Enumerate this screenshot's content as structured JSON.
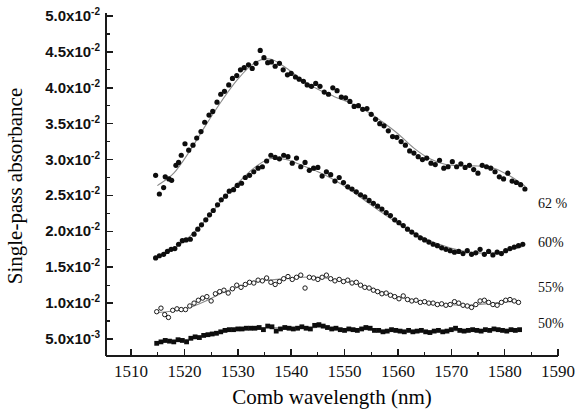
{
  "chart_data": {
    "type": "scatter",
    "title": "",
    "xlabel": "Comb wavelength (nm)",
    "ylabel": "Single-pass absorbance",
    "xlim": [
      1505.3,
      1590
    ],
    "ylim": [
      0.0027,
      0.0505
    ],
    "grid": false,
    "legend_position": "right-inside",
    "xticks": [
      1510,
      1520,
      1530,
      1540,
      1550,
      1560,
      1570,
      1580,
      1590
    ],
    "xtick_labels": [
      "1510",
      "1520",
      "1530",
      "1540",
      "1550",
      "1560",
      "1570",
      "1580",
      "1590"
    ],
    "xminor_interval": 5,
    "yticks": [
      0.005,
      0.01,
      0.015,
      0.02,
      0.025,
      0.03,
      0.035,
      0.04,
      0.045,
      0.05
    ],
    "ytick_labels": [
      {
        "mantissa": "5.0x10",
        "exponent": "-3"
      },
      {
        "mantissa": "1.0x10",
        "exponent": "-2"
      },
      {
        "mantissa": "1.5x10",
        "exponent": "-2"
      },
      {
        "mantissa": "2.0x10",
        "exponent": "-2"
      },
      {
        "mantissa": "2.5x10",
        "exponent": "-2"
      },
      {
        "mantissa": "3.0x10",
        "exponent": "-2"
      },
      {
        "mantissa": "3.5x10",
        "exponent": "-2"
      },
      {
        "mantissa": "4.0x10",
        "exponent": "-2"
      },
      {
        "mantissa": "4.5x10",
        "exponent": "-2"
      },
      {
        "mantissa": "5.0x10",
        "exponent": "-2"
      }
    ],
    "yminor_interval": 0.0025,
    "series": [
      {
        "name": "62 %",
        "label": "62 %",
        "marker": "filled-circle",
        "marker_color": "#0d0d0d",
        "fit_color": "#8a8a8a",
        "x": [
          1514.6,
          1515.3,
          1516.1,
          1516.4,
          1517.1,
          1517.6,
          1518.4,
          1518.9,
          1519.4,
          1520.1,
          1520.8,
          1521.6,
          1522.3,
          1523.1,
          1523.8,
          1524.6,
          1525.3,
          1526.1,
          1526.8,
          1527.5,
          1528.3,
          1529.0,
          1529.8,
          1530.5,
          1531.2,
          1532.0,
          1532.7,
          1533.4,
          1534.2,
          1534.9,
          1535.6,
          1536.3,
          1537.0,
          1537.8,
          1538.5,
          1539.3,
          1540.0,
          1540.8,
          1541.5,
          1542.3,
          1543.0,
          1543.8,
          1544.6,
          1545.4,
          1546.2,
          1547.0,
          1547.8,
          1548.6,
          1549.4,
          1550.2,
          1551.0,
          1551.8,
          1552.6,
          1553.4,
          1554.2,
          1555.0,
          1555.8,
          1556.6,
          1557.4,
          1558.2,
          1559.0,
          1559.8,
          1560.6,
          1561.4,
          1562.2,
          1563.0,
          1563.8,
          1564.6,
          1565.4,
          1566.2,
          1567.0,
          1567.8,
          1568.6,
          1569.4,
          1570.2,
          1571.0,
          1571.8,
          1572.6,
          1573.4,
          1574.2,
          1575.0,
          1575.8,
          1576.6,
          1577.4,
          1578.2,
          1579.0,
          1579.8,
          1580.6,
          1581.4,
          1582.2,
          1583.0,
          1583.8
        ],
        "y": [
          0.0278,
          0.0252,
          0.0261,
          0.0276,
          0.0273,
          0.0271,
          0.0292,
          0.0296,
          0.0306,
          0.0322,
          0.0313,
          0.032,
          0.033,
          0.0339,
          0.0352,
          0.0362,
          0.0367,
          0.038,
          0.0391,
          0.0395,
          0.0404,
          0.0413,
          0.0417,
          0.0425,
          0.0428,
          0.0432,
          0.0427,
          0.0434,
          0.0452,
          0.0442,
          0.0435,
          0.0436,
          0.043,
          0.0434,
          0.0425,
          0.0418,
          0.042,
          0.0415,
          0.0412,
          0.0409,
          0.0404,
          0.0402,
          0.0406,
          0.0402,
          0.0394,
          0.0391,
          0.04,
          0.0396,
          0.0387,
          0.0386,
          0.0381,
          0.0374,
          0.0375,
          0.037,
          0.0371,
          0.0363,
          0.0356,
          0.035,
          0.0347,
          0.034,
          0.0332,
          0.0331,
          0.0325,
          0.032,
          0.0312,
          0.0309,
          0.0304,
          0.03,
          0.0302,
          0.0295,
          0.0293,
          0.0299,
          0.0288,
          0.029,
          0.0297,
          0.029,
          0.0294,
          0.0289,
          0.0292,
          0.0286,
          0.0281,
          0.0292,
          0.029,
          0.0288,
          0.0283,
          0.0276,
          0.0273,
          0.0281,
          0.027,
          0.0268,
          0.0265,
          0.0259
        ],
        "fit_x": [
          1515.0,
          1518.0,
          1521.0,
          1524.0,
          1527.0,
          1530.0,
          1533.0,
          1536.0,
          1539.0,
          1542.0,
          1545.0,
          1548.0,
          1551.0,
          1554.0,
          1557.0,
          1560.0,
          1563.0,
          1566.0,
          1569.0,
          1572.0,
          1575.0,
          1578.0,
          1581.0,
          1583.8
        ],
        "fit_y": [
          0.0264,
          0.0281,
          0.0312,
          0.0348,
          0.0382,
          0.0412,
          0.0434,
          0.044,
          0.0428,
          0.0411,
          0.0398,
          0.0388,
          0.0379,
          0.0368,
          0.0353,
          0.0336,
          0.0316,
          0.0301,
          0.0293,
          0.0291,
          0.0291,
          0.0288,
          0.0277,
          0.0263
        ]
      },
      {
        "name": "60%",
        "label": "60%",
        "marker": "filled-circle",
        "marker_color": "#0d0d0d",
        "fit_color": "#8a8a8a",
        "x": [
          1514.6,
          1515.3,
          1516.1,
          1516.8,
          1517.5,
          1518.2,
          1518.9,
          1519.6,
          1520.3,
          1521.1,
          1521.8,
          1522.5,
          1523.2,
          1524.0,
          1524.7,
          1525.4,
          1526.2,
          1526.9,
          1527.7,
          1528.4,
          1529.2,
          1529.9,
          1530.7,
          1531.4,
          1532.2,
          1533.0,
          1533.8,
          1534.6,
          1535.4,
          1536.2,
          1537.0,
          1537.8,
          1538.6,
          1539.4,
          1540.2,
          1541.0,
          1541.8,
          1542.6,
          1543.4,
          1544.2,
          1545.0,
          1545.8,
          1546.6,
          1547.4,
          1548.2,
          1549.0,
          1549.8,
          1550.6,
          1551.4,
          1552.2,
          1553.0,
          1553.8,
          1554.6,
          1555.4,
          1556.2,
          1557.0,
          1557.8,
          1558.6,
          1559.4,
          1560.2,
          1561.0,
          1561.8,
          1562.6,
          1563.4,
          1564.2,
          1565.0,
          1565.8,
          1566.6,
          1567.4,
          1568.2,
          1569.0,
          1569.8,
          1570.6,
          1571.4,
          1572.2,
          1573.0,
          1573.8,
          1574.6,
          1575.4,
          1576.2,
          1577.0,
          1577.8,
          1578.6,
          1579.4,
          1580.2,
          1581.0,
          1581.8,
          1582.6,
          1583.4
        ],
        "y": [
          0.0163,
          0.0166,
          0.0168,
          0.0172,
          0.0175,
          0.0176,
          0.0182,
          0.0187,
          0.0188,
          0.0189,
          0.0196,
          0.0203,
          0.0209,
          0.0216,
          0.0223,
          0.0229,
          0.0237,
          0.0244,
          0.0249,
          0.0256,
          0.0258,
          0.0264,
          0.0267,
          0.0275,
          0.0278,
          0.0283,
          0.0288,
          0.029,
          0.0298,
          0.0306,
          0.0303,
          0.0301,
          0.0306,
          0.0304,
          0.0295,
          0.0302,
          0.029,
          0.0296,
          0.0285,
          0.0288,
          0.0289,
          0.0277,
          0.0283,
          0.0279,
          0.027,
          0.0275,
          0.0268,
          0.0262,
          0.0259,
          0.0255,
          0.0251,
          0.0248,
          0.0243,
          0.0239,
          0.0235,
          0.0231,
          0.0226,
          0.0222,
          0.0216,
          0.0212,
          0.0208,
          0.0203,
          0.0199,
          0.0195,
          0.0191,
          0.0188,
          0.0185,
          0.0182,
          0.018,
          0.0177,
          0.0175,
          0.0173,
          0.0171,
          0.0172,
          0.0169,
          0.0173,
          0.0168,
          0.017,
          0.0175,
          0.0168,
          0.0172,
          0.0167,
          0.0171,
          0.0169,
          0.0173,
          0.0176,
          0.0178,
          0.018,
          0.0182
        ],
        "fit_x": [
          1515.0,
          1518.0,
          1521.0,
          1524.0,
          1527.0,
          1530.0,
          1533.0,
          1536.0,
          1539.0,
          1542.0,
          1545.0,
          1548.0,
          1551.0,
          1554.0,
          1557.0,
          1560.0,
          1563.0,
          1566.0,
          1569.0,
          1572.0,
          1575.0,
          1578.0,
          1581.0,
          1583.4
        ],
        "fit_y": [
          0.0164,
          0.0176,
          0.0193,
          0.0216,
          0.0243,
          0.0267,
          0.0288,
          0.0301,
          0.03,
          0.0292,
          0.0283,
          0.0272,
          0.0258,
          0.0242,
          0.0226,
          0.0211,
          0.0198,
          0.0187,
          0.0179,
          0.0173,
          0.017,
          0.017,
          0.0174,
          0.0179
        ]
      },
      {
        "name": "55%",
        "label": "55%",
        "marker": "open-circle",
        "marker_color": "#ffffff",
        "fit_color": "#8a8a8a",
        "x": [
          1514.8,
          1515.6,
          1516.3,
          1517.0,
          1517.8,
          1518.6,
          1519.4,
          1520.2,
          1521.0,
          1521.8,
          1522.6,
          1523.4,
          1524.2,
          1525.0,
          1525.8,
          1526.6,
          1527.4,
          1528.2,
          1529.0,
          1529.8,
          1530.6,
          1531.4,
          1532.2,
          1533.0,
          1533.8,
          1534.6,
          1535.4,
          1536.2,
          1537.0,
          1537.8,
          1538.6,
          1539.4,
          1540.2,
          1541.0,
          1541.8,
          1542.6,
          1543.4,
          1544.2,
          1545.0,
          1545.8,
          1546.6,
          1547.4,
          1548.2,
          1549.0,
          1549.8,
          1550.6,
          1551.4,
          1552.2,
          1553.0,
          1553.8,
          1554.6,
          1555.4,
          1556.2,
          1557.0,
          1557.8,
          1558.6,
          1559.4,
          1560.2,
          1561.0,
          1561.8,
          1562.6,
          1563.4,
          1564.2,
          1565.0,
          1565.8,
          1566.6,
          1567.4,
          1568.2,
          1569.0,
          1569.8,
          1570.6,
          1571.4,
          1572.2,
          1573.0,
          1573.8,
          1574.6,
          1575.4,
          1576.2,
          1577.0,
          1577.8,
          1578.6,
          1579.4,
          1580.2,
          1581.0,
          1581.8,
          1582.6
        ],
        "y": [
          0.0088,
          0.0093,
          0.0084,
          0.008,
          0.009,
          0.0092,
          0.0091,
          0.0091,
          0.0096,
          0.01,
          0.0104,
          0.0107,
          0.0109,
          0.0103,
          0.0113,
          0.0116,
          0.0118,
          0.0114,
          0.012,
          0.0125,
          0.0122,
          0.0126,
          0.0129,
          0.0128,
          0.0132,
          0.0131,
          0.0135,
          0.0129,
          0.0126,
          0.013,
          0.0134,
          0.0137,
          0.0133,
          0.0136,
          0.0139,
          0.0121,
          0.0136,
          0.0135,
          0.0133,
          0.0136,
          0.0139,
          0.0134,
          0.0131,
          0.0133,
          0.013,
          0.0132,
          0.0128,
          0.0129,
          0.0125,
          0.0122,
          0.0121,
          0.0118,
          0.0116,
          0.0113,
          0.0114,
          0.0111,
          0.0109,
          0.0106,
          0.011,
          0.0105,
          0.0103,
          0.0104,
          0.0101,
          0.0102,
          0.01,
          0.01,
          0.0098,
          0.0099,
          0.0097,
          0.0098,
          0.0102,
          0.01,
          0.0097,
          0.0096,
          0.0094,
          0.0098,
          0.0103,
          0.0104,
          0.0101,
          0.0098,
          0.0097,
          0.0101,
          0.0104,
          0.0105,
          0.0103,
          0.0101
        ],
        "fit_x": [
          1515.0,
          1518.0,
          1521.0,
          1524.0,
          1527.0,
          1530.0,
          1533.0,
          1536.0,
          1539.0,
          1542.0,
          1545.0,
          1548.0,
          1551.0,
          1554.0,
          1557.0,
          1560.0,
          1563.0,
          1566.0,
          1569.0,
          1572.0,
          1575.0,
          1578.0,
          1581.0,
          1582.6
        ],
        "fit_y": [
          0.0087,
          0.0089,
          0.0094,
          0.0103,
          0.0114,
          0.0122,
          0.0129,
          0.0132,
          0.0134,
          0.0136,
          0.0136,
          0.0133,
          0.0129,
          0.0123,
          0.0116,
          0.0109,
          0.0104,
          0.01,
          0.0098,
          0.0097,
          0.0098,
          0.01,
          0.0102,
          0.0102
        ]
      },
      {
        "name": "50%",
        "label": "50%",
        "marker": "filled-square",
        "marker_color": "#0d0d0d",
        "fit_color": "#8a8a8a",
        "x": [
          1514.8,
          1515.6,
          1516.4,
          1517.2,
          1518.0,
          1518.8,
          1519.6,
          1520.4,
          1521.2,
          1522.0,
          1522.8,
          1523.6,
          1524.4,
          1525.2,
          1526.0,
          1526.8,
          1527.6,
          1528.4,
          1529.2,
          1530.0,
          1530.8,
          1531.6,
          1532.4,
          1533.2,
          1534.0,
          1534.8,
          1535.6,
          1536.4,
          1537.2,
          1538.0,
          1538.8,
          1539.6,
          1540.4,
          1541.2,
          1542.0,
          1542.8,
          1543.6,
          1544.4,
          1545.2,
          1546.0,
          1546.8,
          1547.6,
          1548.4,
          1549.2,
          1550.0,
          1550.8,
          1551.6,
          1552.4,
          1553.2,
          1554.0,
          1554.8,
          1555.6,
          1556.4,
          1557.2,
          1558.0,
          1558.8,
          1559.6,
          1560.4,
          1561.2,
          1562.0,
          1562.8,
          1563.6,
          1564.4,
          1565.2,
          1566.0,
          1566.8,
          1567.6,
          1568.4,
          1569.2,
          1570.0,
          1570.8,
          1571.6,
          1572.4,
          1573.2,
          1574.0,
          1574.8,
          1575.6,
          1576.4,
          1577.2,
          1578.0,
          1578.8,
          1579.6,
          1580.4,
          1581.2,
          1582.0,
          1582.8
        ],
        "y": [
          0.0044,
          0.0046,
          0.0048,
          0.0047,
          0.0046,
          0.0049,
          0.0048,
          0.0046,
          0.0051,
          0.0053,
          0.0052,
          0.0055,
          0.0056,
          0.0057,
          0.0058,
          0.006,
          0.0062,
          0.0063,
          0.0063,
          0.0064,
          0.0064,
          0.0065,
          0.0065,
          0.0065,
          0.0066,
          0.0063,
          0.0068,
          0.0067,
          0.0061,
          0.0064,
          0.0066,
          0.0065,
          0.0064,
          0.0065,
          0.0067,
          0.0065,
          0.0064,
          0.0069,
          0.007,
          0.0068,
          0.0066,
          0.0064,
          0.0065,
          0.0063,
          0.0062,
          0.0064,
          0.0063,
          0.0062,
          0.0064,
          0.0066,
          0.0065,
          0.0062,
          0.0062,
          0.006,
          0.0061,
          0.0063,
          0.0062,
          0.0061,
          0.006,
          0.0062,
          0.006,
          0.0061,
          0.0062,
          0.006,
          0.0059,
          0.0061,
          0.0062,
          0.006,
          0.0061,
          0.0063,
          0.0065,
          0.0062,
          0.0061,
          0.0062,
          0.0063,
          0.0062,
          0.0061,
          0.0063,
          0.0062,
          0.0064,
          0.0063,
          0.0062,
          0.0061,
          0.0063,
          0.0062,
          0.0063
        ],
        "fit_x": [
          1515.0,
          1518.0,
          1521.0,
          1524.0,
          1527.0,
          1530.0,
          1533.0,
          1536.0,
          1539.0,
          1542.0,
          1545.0,
          1548.0,
          1551.0,
          1554.0,
          1557.0,
          1560.0,
          1563.0,
          1566.0,
          1569.0,
          1572.0,
          1575.0,
          1578.0,
          1581.0,
          1582.8
        ],
        "fit_y": [
          0.0045,
          0.0047,
          0.005,
          0.0055,
          0.006,
          0.0063,
          0.0065,
          0.0066,
          0.0065,
          0.0065,
          0.0066,
          0.0065,
          0.0063,
          0.0063,
          0.0062,
          0.0062,
          0.0061,
          0.0061,
          0.0061,
          0.0062,
          0.0062,
          0.0062,
          0.0062,
          0.0062
        ]
      }
    ],
    "series_label_positions": [
      {
        "label": "62 %",
        "x": 1591.0,
        "y": 0.024
      },
      {
        "label": "60%",
        "x": 1591.0,
        "y": 0.0185
      },
      {
        "label": "55%",
        "x": 1591.0,
        "y": 0.0122
      },
      {
        "label": "50%",
        "x": 1591.0,
        "y": 0.0073
      }
    ]
  }
}
